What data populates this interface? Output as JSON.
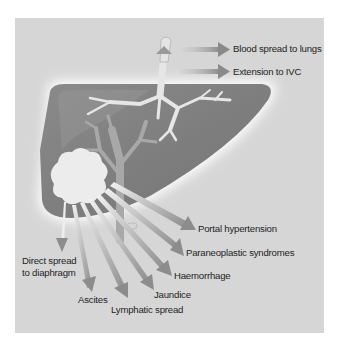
{
  "figure": {
    "colors": {
      "background": "#ffffff",
      "panel": "#d6d6d6",
      "liver": "#7a7a7a",
      "liver_light": "#909090",
      "vessel": "#dcdcdc",
      "tumour": "#ececec",
      "arrow": "#8e8e8e",
      "text": "#1e1e1e"
    },
    "labels": {
      "blood_spread": "Blood spread to lungs",
      "ivc": "Extension to IVC",
      "portal": "Portal hypertension",
      "paraneoplastic": "Paraneoplastic syndromes",
      "haemorrhage": "Haemorrhage",
      "jaundice": "Jaundice",
      "lymphatic": "Lymphatic spread",
      "ascites": "Ascites",
      "diaphragm_line1": "Direct spread",
      "diaphragm_line2": "to diaphragm"
    }
  }
}
